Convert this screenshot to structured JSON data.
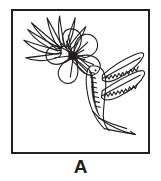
{
  "figure": {
    "label": "A",
    "panel_letter": "A",
    "frame": {
      "border_color": "#231f20",
      "border_width_px": 2,
      "background_color": "#ffffff",
      "x": 11,
      "y": 9,
      "width": 139,
      "height": 145
    },
    "illustration": {
      "title": "Hummingbird feeding at a flower",
      "style": "black line art ink drawing",
      "line_color": "#231f20",
      "fill_color": "#ffffff",
      "subjects": [
        {
          "name": "hummingbird",
          "parts": [
            "long slender beak inserted into flower",
            "head with eye dot",
            "dark shaded throat and breast stripe",
            "upper wing with serrated feather edge",
            "lower wing with serrated feather edge",
            "long tapering forked tail pointing lower right"
          ]
        },
        {
          "name": "flower",
          "parts": [
            "five rounded petals",
            "dark center with radiating stamen lines",
            "fan of seven narrow pointed leaves to upper left",
            "stem"
          ]
        }
      ]
    }
  }
}
